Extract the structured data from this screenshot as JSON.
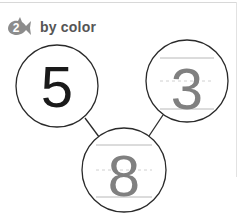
{
  "header": {
    "step_number": "2",
    "title": "by color",
    "icon": "fish-badge-icon"
  },
  "number_bond": {
    "parts": [
      {
        "value": "5",
        "style": "solid",
        "color": "#1a1a1a"
      },
      {
        "value": "3",
        "style": "trace",
        "color": "#808080"
      }
    ],
    "whole": {
      "value": "8",
      "style": "trace",
      "color": "#808080"
    }
  },
  "colors": {
    "icon": "#8c8c8c",
    "circle_stroke": "#2a2a2a",
    "guide_line": "#b8b8b8"
  }
}
